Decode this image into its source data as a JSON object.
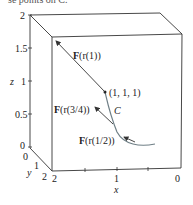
{
  "caption": "se points on C.",
  "axes": {
    "z_label": "z",
    "z_ticks": [
      "2",
      "1.5",
      "1",
      "0.5",
      "0"
    ],
    "y_label": "y",
    "y_ticks": [
      "0",
      "1",
      "2"
    ],
    "x_label": "x",
    "x_ticks": [
      "2",
      "1",
      "0"
    ]
  },
  "annotations": {
    "point": "(1, 1, 1)",
    "curve": "C",
    "f_r1_prefix": "F",
    "f_r1_rest": "(r(1))",
    "f_r34_prefix": "F",
    "f_r34_rest": "(r(3/4))",
    "f_r12_prefix": "F",
    "f_r12_rest": "(r(1/2))"
  },
  "colors": {
    "box": "#333333",
    "curve": "#6f7f86",
    "arrow": "#333333"
  }
}
